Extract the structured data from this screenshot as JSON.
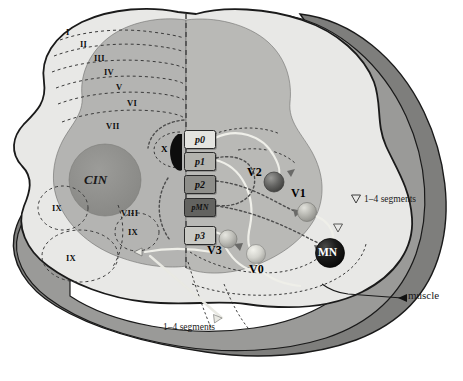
{
  "figure": {
    "type": "diagram"
  },
  "colors": {
    "background": "#ffffff",
    "white_matter": "#e8e8e6",
    "gray_matter": "#b4b4b2",
    "gray_matter_right": "#b9b9b6",
    "outer_band_mid": "#9a9a98",
    "outer_band_dark": "#7e7e7c",
    "cin_circle": "#8f8f8d",
    "outline": "#1a1a1a",
    "dashed_lamina": "#3a3a3a",
    "midline": "#4a4a4a",
    "neuron_dark": "#5e5e5c",
    "neuron_mid": "#a8a8a4",
    "neuron_light": "#cfcfc9",
    "neuron_black": "#121212",
    "axon_light": "#efefe9",
    "axon_dark": "#4d4d4d",
    "p0": "#e4e4e0",
    "p1": "#b3b3ae",
    "p2": "#8e8e8a",
    "pMN": "#636360",
    "p3": "#c9c9c4"
  },
  "laminae": {
    "label": "Rexed laminae",
    "items": [
      {
        "numeral": "I",
        "x": 70,
        "y": 32
      },
      {
        "numeral": "II",
        "x": 84,
        "y": 44
      },
      {
        "numeral": "III",
        "x": 98,
        "y": 58
      },
      {
        "numeral": "IV",
        "x": 107,
        "y": 72
      },
      {
        "numeral": "V",
        "x": 118,
        "y": 87
      },
      {
        "numeral": "VI",
        "x": 130,
        "y": 103
      },
      {
        "numeral": "VII",
        "x": 110,
        "y": 126
      },
      {
        "numeral": "VIII",
        "x": 126,
        "y": 213
      },
      {
        "numeral": "IX",
        "x": 56,
        "y": 208
      },
      {
        "numeral": "IX",
        "x": 131,
        "y": 232
      },
      {
        "numeral": "IX",
        "x": 70,
        "y": 258
      }
    ]
  },
  "central_canal": {
    "label": "X",
    "x": 163,
    "y": 143
  },
  "cin": {
    "label": "CIN",
    "x": 98,
    "y": 180
  },
  "progenitor_domains": {
    "label": "ventral progenitor domains",
    "items": [
      {
        "id": "p0",
        "label": "p0",
        "x": 184,
        "y": 130,
        "w": 30,
        "h": 17,
        "fill": "#e4e4e0",
        "text": "#111111"
      },
      {
        "id": "p1",
        "label": "p1",
        "x": 184,
        "y": 152,
        "w": 30,
        "h": 17,
        "fill": "#b3b3ae",
        "text": "#111111"
      },
      {
        "id": "p2",
        "label": "p2",
        "x": 184,
        "y": 175,
        "w": 30,
        "h": 17,
        "fill": "#8e8e8a",
        "text": "#0c0c0c"
      },
      {
        "id": "pMN",
        "label": "pMN",
        "x": 184,
        "y": 198,
        "w": 30,
        "h": 17,
        "fill": "#636360",
        "text": "#111111"
      },
      {
        "id": "p3",
        "label": "p3",
        "x": 184,
        "y": 226,
        "w": 30,
        "h": 17,
        "fill": "#c9c9c4",
        "text": "#111111"
      }
    ]
  },
  "neurons": {
    "label": "derived neuron classes",
    "items": [
      {
        "id": "V2",
        "label": "V2",
        "cx": 274,
        "cy": 182,
        "r": 10,
        "fill": "#5e5e5c",
        "label_x": 248,
        "label_y": 170
      },
      {
        "id": "V1",
        "label": "V1",
        "cx": 307,
        "cy": 212,
        "r": 9.5,
        "fill": "#b0b0aa",
        "label_x": 291,
        "label_y": 192
      },
      {
        "id": "V3",
        "label": "V3",
        "cx": 228,
        "cy": 239,
        "r": 9,
        "fill": "#bdbdb7",
        "label_x": 232,
        "label_y": 250
      },
      {
        "id": "V0",
        "label": "V0",
        "cx": 256,
        "cy": 254,
        "r": 9.5,
        "fill": "#d5d5cf",
        "label_x": 260,
        "label_y": 265
      },
      {
        "id": "MN",
        "label": "MN",
        "cx": 330,
        "cy": 253,
        "r": 14.5,
        "fill": "#121212",
        "label_x": 330,
        "label_y": 253
      }
    ]
  },
  "annotations": [
    {
      "id": "segments-right",
      "text": "1–4 segments",
      "x": 364,
      "y": 199
    },
    {
      "id": "segments-bottom",
      "text": "1–4 segments",
      "x": 163,
      "y": 327
    },
    {
      "id": "muscle",
      "text": "muscle",
      "x": 408,
      "y": 295
    }
  ]
}
